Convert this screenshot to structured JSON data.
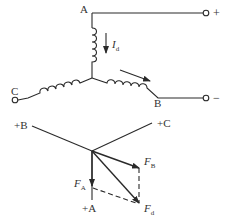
{
  "circuit": {
    "terminals": {
      "A": "A",
      "B": "B",
      "C": "C",
      "plus": "+",
      "minus": "−"
    },
    "current": {
      "symbol": "I",
      "subscript": "d"
    }
  },
  "phasor": {
    "axes": {
      "plusA": "+A",
      "plusB": "+B",
      "plusC": "+C"
    },
    "vectors": {
      "FA": {
        "symbol": "F",
        "subscript": "A"
      },
      "FB": {
        "symbol": "F",
        "subscript": "B"
      },
      "Fd": {
        "symbol": "F",
        "subscript": "d"
      }
    }
  },
  "colors": {
    "line": "#2a2a2a",
    "text": "#333333"
  }
}
